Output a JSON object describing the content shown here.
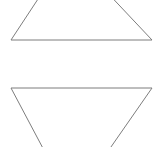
{
  "canvas": {
    "width": 153,
    "height": 147,
    "background_color": "#ffffff",
    "description": "Two outlined triangles on a blank white canvas"
  },
  "style": {
    "stroke_color": "#7d7d7d",
    "stroke_width": 1,
    "fill": "none"
  },
  "shapes": [
    {
      "name": "upper-triangle",
      "label": "Upward triangle, apex cropped above canvas",
      "orientation": "point-up",
      "points": "69,-48 11,40 152,40",
      "visible_vertices": [
        {
          "x": 11,
          "y": 40
        },
        {
          "x": 152,
          "y": 40
        }
      ],
      "base_y": 40
    },
    {
      "name": "lower-triangle",
      "label": "Downward triangle, apex cropped below canvas",
      "orientation": "point-down",
      "points": "11,88 152,88 72,203",
      "visible_vertices": [
        {
          "x": 11,
          "y": 88
        },
        {
          "x": 152,
          "y": 88
        }
      ],
      "base_y": 88
    }
  ]
}
